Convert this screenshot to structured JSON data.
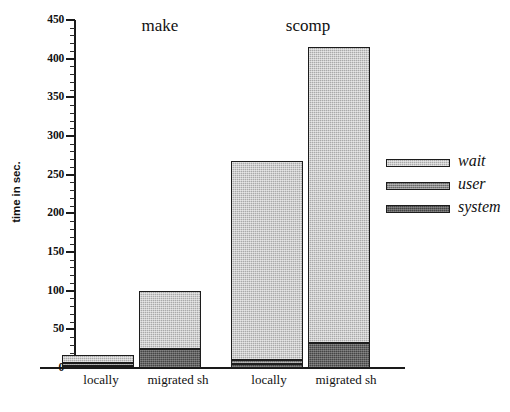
{
  "chart_data": {
    "type": "bar",
    "subtype": "stacked-grouped-bar",
    "title": "",
    "xlabel": "",
    "ylabel": "time in sec.",
    "ylim": [
      0,
      450
    ],
    "y_major_tick_step": 50,
    "y_minor_tick_step": 10,
    "grid": false,
    "legend_position": "right",
    "y_tick_labels": [
      "0",
      "50",
      "100",
      "150",
      "200",
      "250",
      "300",
      "350",
      "400",
      "450"
    ],
    "groups": [
      {
        "name": "make",
        "categories": [
          "locally",
          "migrated sh"
        ]
      },
      {
        "name": "scomp",
        "categories": [
          "locally",
          "migrated sh"
        ]
      }
    ],
    "categories": [
      "locally",
      "migrated sh",
      "locally",
      "migrated sh"
    ],
    "series": [
      {
        "name": "wait",
        "color": "#a9a9a9",
        "values": [
          11,
          76,
          257,
          383
        ]
      },
      {
        "name": "user",
        "color": "#868686",
        "values": [
          3,
          0,
          6,
          0
        ]
      },
      {
        "name": "system",
        "color": "#454545",
        "values": [
          3,
          24,
          5,
          32
        ]
      }
    ],
    "totals": [
      17,
      100,
      268,
      415
    ],
    "bars": [
      {
        "group": "make",
        "category": "locally",
        "wait": 11,
        "user": 3,
        "system": 3,
        "total": 17
      },
      {
        "group": "make",
        "category": "migrated sh",
        "wait": 76,
        "user": 0,
        "system": 24,
        "total": 100
      },
      {
        "group": "scomp",
        "category": "locally",
        "wait": 257,
        "user": 6,
        "system": 5,
        "total": 268
      },
      {
        "group": "scomp",
        "category": "migrated sh",
        "wait": 383,
        "user": 0,
        "system": 32,
        "total": 415
      }
    ]
  },
  "axis": {
    "y_title": "time in sec.",
    "ticks": [
      {
        "label": "450",
        "value": 450
      },
      {
        "label": "400",
        "value": 400
      },
      {
        "label": "350",
        "value": 350
      },
      {
        "label": "300",
        "value": 300
      },
      {
        "label": "250",
        "value": 250
      },
      {
        "label": "200",
        "value": 200
      },
      {
        "label": "150",
        "value": 150
      },
      {
        "label": "100",
        "value": 100
      },
      {
        "label": "50",
        "value": 50
      },
      {
        "label": "0",
        "value": 0
      }
    ]
  },
  "groups": [
    {
      "title": "make"
    },
    {
      "title": "scomp"
    }
  ],
  "category_labels": [
    {
      "text": "locally"
    },
    {
      "text": "migrated sh"
    },
    {
      "text": "locally"
    },
    {
      "text": "migrated sh"
    }
  ],
  "legend": {
    "items": [
      {
        "label": "wait",
        "color": "#a9a9a9"
      },
      {
        "label": "user",
        "color": "#868686"
      },
      {
        "label": "system",
        "color": "#454545"
      }
    ]
  },
  "caption": {
    "text": ""
  }
}
